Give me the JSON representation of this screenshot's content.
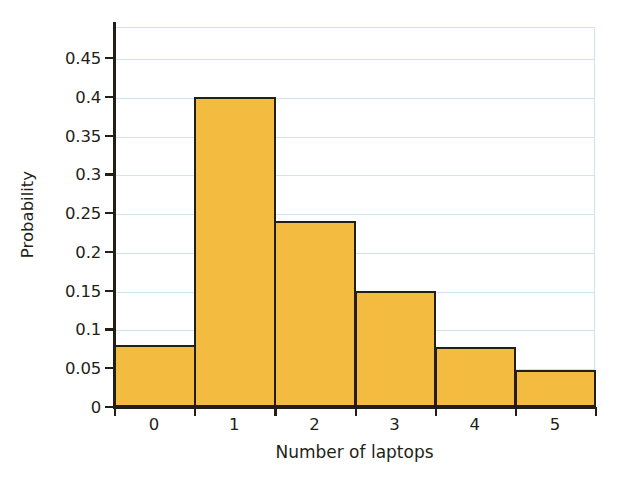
{
  "chart_data": {
    "type": "bar",
    "title": "",
    "subtitle": "",
    "xlabel": "Number of laptops",
    "ylabel": "Probability",
    "categories": [
      "0",
      "1",
      "2",
      "3",
      "4",
      "5"
    ],
    "values": [
      0.08,
      0.4,
      0.24,
      0.15,
      0.078,
      0.048
    ],
    "series": [
      {
        "name": "Probability",
        "values": [
          0.08,
          0.4,
          0.24,
          0.15,
          0.078,
          0.048
        ]
      }
    ],
    "xlim": [
      -0.5,
      5.5
    ],
    "ylim": [
      0,
      0.45
    ],
    "yticks": [
      0,
      0.05,
      0.1,
      0.15,
      0.2,
      0.25,
      0.3,
      0.35,
      0.4,
      0.45
    ],
    "ytick_labels": [
      "0",
      "0.05",
      "0.1",
      "0.15",
      "0.2",
      "0.25",
      "0.3",
      "0.35",
      "0.4",
      "0.45"
    ],
    "xtick_labels": [
      "0",
      "1",
      "2",
      "3",
      "4",
      "5"
    ],
    "grid": true,
    "grid_axis": "y",
    "grid_color": "#cfe6f2",
    "legend": false,
    "legend_position": "none",
    "bar_color": "#f3bb3f",
    "bar_edge_color": "#231f17",
    "bar_width": 1.0,
    "axis_color": "#231f17",
    "background_color": "#ffffff",
    "annotations": []
  }
}
